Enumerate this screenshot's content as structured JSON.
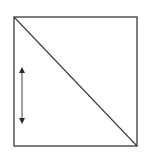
{
  "diagram": {
    "type": "square-with-diagonal-and-double-arrow",
    "colors": {
      "background": "#ffffff",
      "stroke": "#3a3a3a",
      "arrow": "#2a2a2a"
    },
    "square": {
      "x1": 14,
      "y1": 17,
      "x2": 137,
      "y2": 146
    },
    "diagonal": {
      "from": "top-left",
      "to": "bottom-right"
    },
    "double_arrow": {
      "x": 22,
      "y1": 67,
      "y2": 124,
      "orientation": "vertical"
    }
  }
}
